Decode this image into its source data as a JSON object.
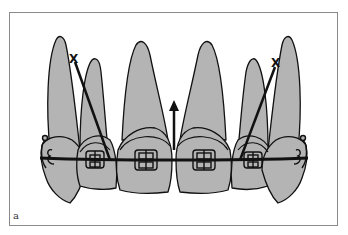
{
  "figure": {
    "panel_label": "a",
    "markers": [
      {
        "type": "x-mark",
        "label": "X",
        "side": "left"
      },
      {
        "type": "x-mark",
        "label": "X",
        "side": "right"
      }
    ],
    "arrow": {
      "direction": "up",
      "position": "midline"
    },
    "colors": {
      "tooth_fill": "#b4b4b4",
      "outline": "#111111",
      "frame": "#8a8a8a",
      "background": "#ffffff"
    }
  }
}
